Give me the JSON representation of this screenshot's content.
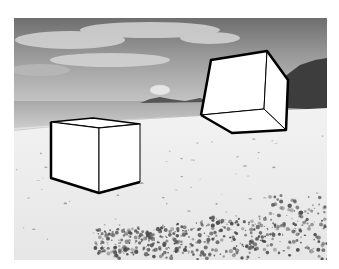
{
  "image": {
    "description": "Black-and-white beach photograph with two white cubes drawn in perspective",
    "palette": {
      "background": "#ffffff",
      "sky_dark": "#6a6a6a",
      "sky_light": "#c8c8c8",
      "sea": "#b4b4b4",
      "sand": "#eeeeee",
      "vegetation": "#3a3a3a",
      "cube_fill": "#ffffff",
      "cube_stroke": "#000000"
    },
    "objects": [
      {
        "name": "sky",
        "kind": "region"
      },
      {
        "name": "clouds",
        "kind": "region"
      },
      {
        "name": "sea",
        "kind": "region"
      },
      {
        "name": "distant-islets",
        "kind": "region"
      },
      {
        "name": "hillside-forest",
        "kind": "region"
      },
      {
        "name": "sandy-beach",
        "kind": "region"
      },
      {
        "name": "beach-shrubs",
        "kind": "region"
      },
      {
        "name": "cube-left",
        "kind": "drawn-cube",
        "orientation": "resting on sand, viewed from above"
      },
      {
        "name": "cube-right",
        "kind": "drawn-cube",
        "orientation": "floating, viewed from below"
      }
    ]
  }
}
